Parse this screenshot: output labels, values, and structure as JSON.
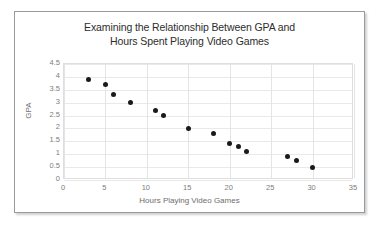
{
  "chart_data": {
    "type": "scatter",
    "title": "Examining the Relationship Between GPA and Hours Spent Playing Video Games",
    "title_line_1": "Examining the Relationship Between GPA and",
    "title_line_2": "Hours Spent Playing Video Games",
    "xlabel": "Hours Playing Video Games",
    "ylabel": "GPA",
    "xlim": [
      0,
      35
    ],
    "ylim": [
      0,
      4.5
    ],
    "xticks": [
      0,
      5,
      10,
      15,
      20,
      25,
      30,
      35
    ],
    "xtick_labels": [
      "0",
      "5",
      "10",
      "15",
      "20",
      "25",
      "30",
      "35"
    ],
    "yticks": [
      0,
      0.5,
      1,
      1.5,
      2,
      2.5,
      3,
      3.5,
      4,
      4.5
    ],
    "ytick_labels": [
      "0",
      "0.5",
      "1",
      "1.5",
      "2",
      "2.5",
      "3",
      "3.5",
      "4",
      "4.5"
    ],
    "grid": "both",
    "legend": "none",
    "marker_color": "#1a1a1a",
    "marker_size": 5,
    "points": [
      {
        "x": 3,
        "y": 3.9
      },
      {
        "x": 5,
        "y": 3.7
      },
      {
        "x": 6,
        "y": 3.3
      },
      {
        "x": 8,
        "y": 3.0
      },
      {
        "x": 11,
        "y": 2.7
      },
      {
        "x": 12,
        "y": 2.5
      },
      {
        "x": 15,
        "y": 2.0
      },
      {
        "x": 18,
        "y": 1.8
      },
      {
        "x": 20,
        "y": 1.4
      },
      {
        "x": 21,
        "y": 1.3
      },
      {
        "x": 22,
        "y": 1.1
      },
      {
        "x": 27,
        "y": 0.9
      },
      {
        "x": 28,
        "y": 0.75
      },
      {
        "x": 30,
        "y": 0.5
      }
    ]
  },
  "colors": {
    "border": "#9a9a9a",
    "gridline": "#e9e9e9",
    "plot_border": "#dedede",
    "tick_text": "#7d7d7d",
    "title_text": "#2d2d2d",
    "marker": "#1a1a1a"
  }
}
